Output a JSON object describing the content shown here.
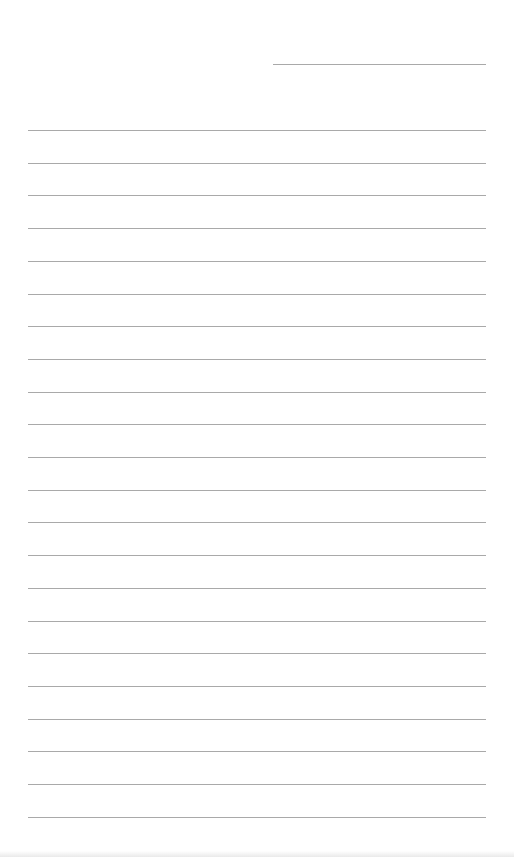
{
  "document": {
    "type": "lined-writing-sheet",
    "header_line": {
      "text": "",
      "x": 273,
      "y": 64,
      "width": 213
    },
    "ruled_lines": {
      "count": 22,
      "start_y": 130,
      "spacing": 32.7,
      "x": 28,
      "width": 458,
      "texts": [
        "",
        "",
        "",
        "",
        "",
        "",
        "",
        "",
        "",
        "",
        "",
        "",
        "",
        "",
        "",
        "",
        "",
        "",
        "",
        "",
        "",
        ""
      ]
    },
    "colors": {
      "paper": "#ffffff",
      "rule": "#a9a9a9"
    }
  }
}
